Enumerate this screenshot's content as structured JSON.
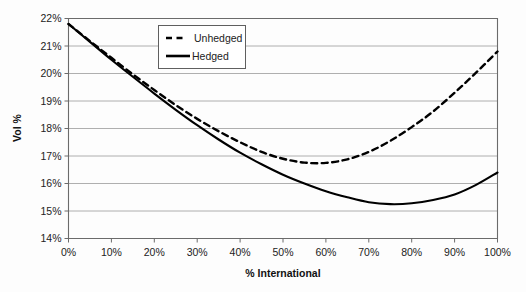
{
  "chart_data": {
    "type": "line",
    "title": "",
    "xlabel": "% International",
    "ylabel": "Vol %",
    "xlim": [
      0,
      100
    ],
    "ylim": [
      14,
      22
    ],
    "grid": true,
    "legend_position": "top-center-inside",
    "x_tick_labels": [
      "0%",
      "10%",
      "20%",
      "30%",
      "40%",
      "50%",
      "60%",
      "70%",
      "80%",
      "90%",
      "100%"
    ],
    "x_ticks": [
      0,
      10,
      20,
      30,
      40,
      50,
      60,
      70,
      80,
      90,
      100
    ],
    "y_tick_labels": [
      "14%",
      "15%",
      "16%",
      "17%",
      "18%",
      "19%",
      "20%",
      "21%",
      "22%"
    ],
    "y_ticks": [
      14,
      15,
      16,
      17,
      18,
      19,
      20,
      21,
      22
    ],
    "x": [
      0,
      5,
      10,
      15,
      20,
      25,
      30,
      35,
      40,
      45,
      50,
      55,
      60,
      65,
      70,
      75,
      80,
      85,
      90,
      95,
      100
    ],
    "series": [
      {
        "name": "Unhedged",
        "style": "dashed",
        "color": "#000000",
        "values": [
          21.8,
          21.18,
          20.57,
          19.97,
          19.4,
          18.85,
          18.35,
          17.9,
          17.5,
          17.15,
          16.9,
          16.76,
          16.75,
          16.88,
          17.15,
          17.55,
          18.05,
          18.62,
          19.3,
          20.03,
          20.8
        ]
      },
      {
        "name": "Hedged",
        "style": "solid",
        "color": "#000000",
        "values": [
          21.8,
          21.15,
          20.5,
          19.88,
          19.27,
          18.68,
          18.12,
          17.6,
          17.12,
          16.7,
          16.32,
          16.0,
          15.72,
          15.5,
          15.32,
          15.25,
          15.28,
          15.4,
          15.6,
          15.95,
          16.4
        ]
      }
    ],
    "legend_entries": [
      {
        "label": "Unhedged",
        "style": "dashed"
      },
      {
        "label": "Hedged",
        "style": "solid"
      }
    ]
  },
  "colors": {
    "grid": "#9a9a9a",
    "frame": "#6b6b6b",
    "line": "#000000",
    "background": "#fdfdfd"
  }
}
